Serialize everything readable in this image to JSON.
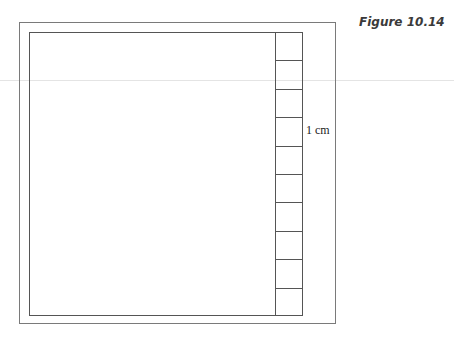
{
  "figure": {
    "title": "Figure 10.14"
  },
  "diagram": {
    "ruler": {
      "segment_count": 10,
      "unit_label": "1 cm"
    },
    "colors": {
      "outer_frame": "#7a7a7a",
      "inner_frame": "#555555",
      "title": "#3a3a3a"
    }
  }
}
